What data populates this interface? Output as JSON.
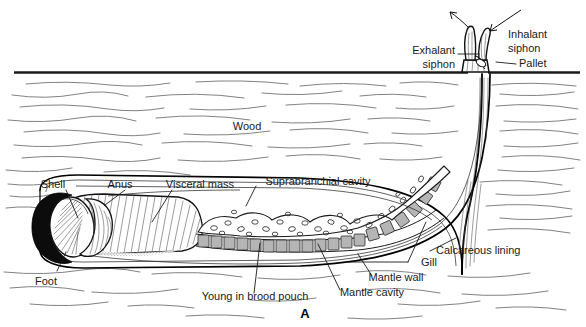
{
  "figure": {
    "panel_letter": "A",
    "background_color": "#ffffff",
    "ink_color": "#000000",
    "grain_color": "#808286"
  },
  "labels": {
    "wood": "Wood",
    "shell": "Shell",
    "anus": "Anus",
    "visceral_mass": "Visceral mass",
    "suprabranchial_cavity": "Suprabranchial cavity",
    "foot": "Foot",
    "young_in_brood_pouch": "Young in brood pouch",
    "mantle_cavity": "Mantle cavity",
    "mantle_wall": "Mantle wall",
    "gill": "Gill",
    "calcareous_lining": "Calcareous lining",
    "exhalant_siphon_line1": "Exhalant",
    "exhalant_siphon_line2": "siphon",
    "inhalant_siphon_line1": "Inhalant",
    "inhalant_siphon_line2": "siphon",
    "pallet": "Pallet"
  },
  "structures": {
    "wood_surface": "wood-surface-line",
    "burrow_tube": "calcareous-burrow-tube",
    "animal_body": "shipworm-body",
    "shell_valves": "boring-shell-valves",
    "gill_filaments": "gill-filament-row",
    "brood_pouch": "brood-pouch-region",
    "siphon_pair": "siphon-pair",
    "pallet_pair": "pallet-pair"
  },
  "water_flow": {
    "inhalant_arrow": "arrow-into-inhalant-siphon",
    "exhalant_arrow": "arrow-out-of-exhalant-siphon"
  }
}
